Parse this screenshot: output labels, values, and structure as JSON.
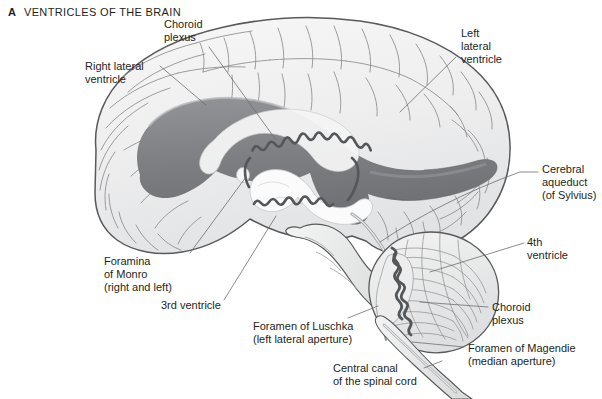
{
  "figure": {
    "panel_letter": "A",
    "title": "VENTRICLES OF THE BRAIN"
  },
  "colors": {
    "background": "#ffffff",
    "text": "#231f20",
    "brain_fill": "#f1f1f1",
    "brain_outline": "#58595b",
    "gyri_line": "#8c8d8f",
    "ventricle_dark": "#7d7f82",
    "ventricle_mid": "#a7a9ac",
    "ventricle_light": "#d9dadb",
    "choroid_plexus": "#5e6063",
    "leader_line": "#6d6e71"
  },
  "labels": [
    {
      "id": "choroid-plexus-top",
      "lines": [
        "Choroid",
        "plexus"
      ],
      "text": "Choroid\nplexus",
      "position": "top-center-left",
      "leader_target": "lateral-ventricle-choroid-plexus"
    },
    {
      "id": "right-lateral-ventricle",
      "lines": [
        "Right lateral",
        "ventricle"
      ],
      "text": "Right lateral\nventricle",
      "position": "upper-left",
      "leader_target": "right-lateral-ventricle-body"
    },
    {
      "id": "left-lateral-ventricle",
      "lines": [
        "Left",
        "lateral",
        "ventricle"
      ],
      "text": "Left\nlateral\nventricle",
      "position": "upper-right",
      "leader_target": "left-lateral-ventricle-body"
    },
    {
      "id": "cerebral-aqueduct",
      "lines": [
        "Cerebral",
        "aqueduct",
        "(of Sylvius)"
      ],
      "text": "Cerebral\naqueduct\n(of Sylvius)",
      "position": "right",
      "leader_target": "cerebral-aqueduct-channel"
    },
    {
      "id": "fourth-ventricle",
      "lines": [
        "4th",
        "ventricle"
      ],
      "text": "4th\nventricle",
      "position": "right",
      "leader_target": "fourth-ventricle-cavity"
    },
    {
      "id": "choroid-plexus-bottom",
      "lines": [
        "Choroid",
        "plexus"
      ],
      "text": "Choroid\nplexus",
      "position": "lower-right",
      "leader_target": "fourth-ventricle-choroid-plexus"
    },
    {
      "id": "foramen-of-magendie",
      "lines": [
        "Foramen of Magendie",
        "(median aperture)"
      ],
      "text": "Foramen of Magendie\n(median aperture)",
      "position": "bottom-right",
      "leader_target": "median-aperture"
    },
    {
      "id": "foramen-of-luschka",
      "lines": [
        "Foramen of Luschka",
        "(left lateral aperture)"
      ],
      "text": "Foramen of Luschka\n(left lateral aperture)",
      "position": "bottom-center",
      "leader_target": "lateral-aperture"
    },
    {
      "id": "central-canal",
      "lines": [
        "Central canal",
        "of the spinal cord"
      ],
      "text": "Central canal\nof the spinal cord",
      "position": "bottom-center-right",
      "leader_target": "spinal-cord-central-canal"
    },
    {
      "id": "foramina-of-monro",
      "lines": [
        "Foramina",
        "of Monro",
        "(right and left)"
      ],
      "text": "Foramina\nof Monro\n(right and left)",
      "position": "lower-left",
      "leader_target": "interventricular-foramen"
    },
    {
      "id": "third-ventricle",
      "lines": [
        "3rd ventricle"
      ],
      "text": "3rd ventricle",
      "position": "lower-left-center",
      "leader_target": "third-ventricle-cavity"
    }
  ]
}
